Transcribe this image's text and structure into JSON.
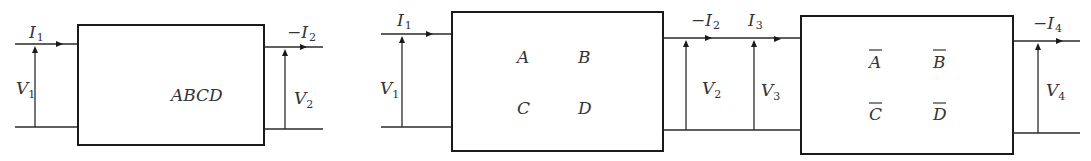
{
  "diagrams": {
    "single": {
      "block_label": "ABCD",
      "input_current": {
        "prefix": "",
        "symbol": "I",
        "sub": "1"
      },
      "input_voltage": {
        "symbol": "V",
        "sub": "1"
      },
      "output_current": {
        "prefix": "−",
        "symbol": "I",
        "sub": "2"
      },
      "output_voltage": {
        "symbol": "V",
        "sub": "2"
      }
    },
    "cascade": {
      "block1": {
        "a": "A",
        "b": "B",
        "c": "C",
        "d": "D"
      },
      "block2": {
        "a": "A",
        "b": "B",
        "c": "C",
        "d": "D",
        "overbar": true
      },
      "i1": {
        "prefix": "",
        "symbol": "I",
        "sub": "1"
      },
      "v1": {
        "symbol": "V",
        "sub": "1"
      },
      "i2": {
        "prefix": "−",
        "symbol": "I",
        "sub": "2"
      },
      "v2": {
        "symbol": "V",
        "sub": "2"
      },
      "i3": {
        "prefix": "",
        "symbol": "I",
        "sub": "3"
      },
      "v3": {
        "symbol": "V",
        "sub": "3"
      },
      "i4": {
        "prefix": "−",
        "symbol": "I",
        "sub": "4"
      },
      "v4": {
        "symbol": "V",
        "sub": "4"
      }
    }
  },
  "colors": {
    "line": "#1a1a1a",
    "text": "#333333",
    "background": "#ffffff"
  }
}
